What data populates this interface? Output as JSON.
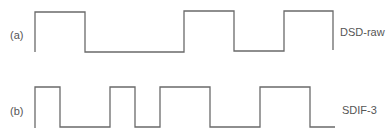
{
  "diagram": {
    "type": "digital-waveform-comparison",
    "rows": [
      {
        "id": "a",
        "tag": "(a)",
        "label": "DSD-raw",
        "bits": [
          1,
          0,
          0,
          1,
          0,
          1
        ]
      },
      {
        "id": "b",
        "tag": "(b)",
        "label": "SDIF-3",
        "bits": [
          1,
          0,
          1,
          0,
          1,
          0,
          1,
          0
        ]
      }
    ],
    "colors": {
      "stroke": "#6a6a6a",
      "text": "#555555",
      "background": "#ffffff"
    }
  }
}
